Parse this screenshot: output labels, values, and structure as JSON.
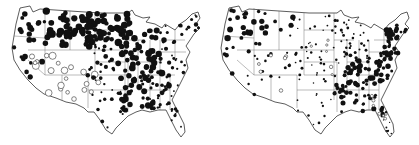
{
  "figure": {
    "background": "#ffffff",
    "ink_color": "#111111",
    "maps": [
      {
        "id": "left-map",
        "offset_x": 0,
        "seed": 11,
        "regions": [
          {
            "name": "pacific-northwest",
            "x": [
              18,
              45
            ],
            "y": [
              12,
              45
            ],
            "count": 14,
            "r": [
              1.5,
              3.2
            ],
            "type": "filled"
          },
          {
            "name": "idaho-montana",
            "x": [
              45,
              95
            ],
            "y": [
              8,
              48
            ],
            "count": 26,
            "r": [
              2.2,
              4.0
            ],
            "type": "filled"
          },
          {
            "name": "wyoming-dakotas",
            "x": [
              60,
              130
            ],
            "y": [
              14,
              45
            ],
            "count": 30,
            "r": [
              2.0,
              3.8
            ],
            "type": "filled"
          },
          {
            "name": "north-dakota-minnesota",
            "x": [
              85,
              130
            ],
            "y": [
              12,
              40
            ],
            "count": 34,
            "r": [
              2.0,
              3.6
            ],
            "type": "filled"
          },
          {
            "name": "california-nevada",
            "x": [
              12,
              45
            ],
            "y": [
              45,
              85
            ],
            "count": 10,
            "r": [
              1.5,
              3.0
            ],
            "type": "filled"
          },
          {
            "name": "great-basin-open",
            "x": [
              30,
              75
            ],
            "y": [
              55,
              105
            ],
            "count": 12,
            "r": [
              1.8,
              3.8
            ],
            "type": "open"
          },
          {
            "name": "southwest-open",
            "x": [
              55,
              100
            ],
            "y": [
              70,
              100
            ],
            "count": 10,
            "r": [
              1.8,
              3.5
            ],
            "type": "open"
          },
          {
            "name": "plains",
            "x": [
              85,
              125
            ],
            "y": [
              45,
              80
            ],
            "count": 26,
            "r": [
              1.0,
              2.4
            ],
            "type": "filled"
          },
          {
            "name": "texas-oklahoma",
            "x": [
              88,
              130
            ],
            "y": [
              78,
              130
            ],
            "count": 16,
            "r": [
              0.9,
              2.0
            ],
            "type": "filled"
          },
          {
            "name": "midwest",
            "x": [
              118,
              165
            ],
            "y": [
              30,
              80
            ],
            "count": 55,
            "r": [
              1.8,
              3.4
            ],
            "type": "filled"
          },
          {
            "name": "south-central",
            "x": [
              118,
              170
            ],
            "y": [
              75,
              110
            ],
            "count": 45,
            "r": [
              1.5,
              3.2
            ],
            "type": "filled"
          },
          {
            "name": "southeast",
            "x": [
              145,
              190
            ],
            "y": [
              70,
              128
            ],
            "count": 28,
            "r": [
              0.8,
              1.8
            ],
            "type": "filled"
          },
          {
            "name": "northeast",
            "x": [
              160,
              200
            ],
            "y": [
              15,
              70
            ],
            "count": 30,
            "r": [
              0.9,
              2.2
            ],
            "type": "filled"
          }
        ]
      },
      {
        "id": "right-map",
        "offset_x": 209,
        "seed": 47,
        "regions": [
          {
            "name": "pacific-northwest",
            "x": [
              18,
              48
            ],
            "y": [
              10,
              45
            ],
            "count": 16,
            "r": [
              1.5,
              3.2
            ],
            "type": "filled"
          },
          {
            "name": "idaho-montana",
            "x": [
              40,
              85
            ],
            "y": [
              10,
              45
            ],
            "count": 14,
            "r": [
              1.5,
              2.8
            ],
            "type": "filled"
          },
          {
            "name": "california-nevada",
            "x": [
              12,
              50
            ],
            "y": [
              45,
              85
            ],
            "count": 9,
            "r": [
              1.0,
              2.4
            ],
            "type": "filled"
          },
          {
            "name": "mountain-west",
            "x": [
              45,
              95
            ],
            "y": [
              45,
              95
            ],
            "count": 16,
            "r": [
              0.8,
              1.8
            ],
            "type": "filled"
          },
          {
            "name": "mountain-west-open",
            "x": [
              45,
              95
            ],
            "y": [
              50,
              95
            ],
            "count": 6,
            "r": [
              1.0,
              1.8
            ],
            "type": "open"
          },
          {
            "name": "plains",
            "x": [
              80,
              130
            ],
            "y": [
              15,
              80
            ],
            "count": 38,
            "r": [
              0.7,
              1.4
            ],
            "type": "filled"
          },
          {
            "name": "plains-open",
            "x": [
              85,
              125
            ],
            "y": [
              40,
              75
            ],
            "count": 6,
            "r": [
              1.0,
              1.8
            ],
            "type": "open"
          },
          {
            "name": "texas-oklahoma",
            "x": [
              85,
              130
            ],
            "y": [
              78,
              128
            ],
            "count": 16,
            "r": [
              0.7,
              1.4
            ],
            "type": "filled"
          },
          {
            "name": "upper-midwest",
            "x": [
              125,
              160
            ],
            "y": [
              20,
              60
            ],
            "count": 30,
            "r": [
              0.8,
              1.6
            ],
            "type": "filled"
          },
          {
            "name": "ohio-valley",
            "x": [
              135,
              190
            ],
            "y": [
              52,
              85
            ],
            "count": 55,
            "r": [
              1.4,
              2.8
            ],
            "type": "filled"
          },
          {
            "name": "deep-south",
            "x": [
              125,
              175
            ],
            "y": [
              80,
              120
            ],
            "count": 40,
            "r": [
              1.2,
              2.6
            ],
            "type": "filled"
          },
          {
            "name": "southeast-open",
            "x": [
              160,
              185
            ],
            "y": [
              95,
              125
            ],
            "count": 8,
            "r": [
              1.0,
              1.8
            ],
            "type": "open"
          },
          {
            "name": "florida",
            "x": [
              170,
              188
            ],
            "y": [
              110,
              140
            ],
            "count": 8,
            "r": [
              0.6,
              1.2
            ],
            "type": "filled"
          },
          {
            "name": "northeast",
            "x": [
              175,
              205
            ],
            "y": [
              25,
              60
            ],
            "count": 36,
            "r": [
              1.4,
              2.8
            ],
            "type": "filled"
          }
        ]
      }
    ]
  }
}
